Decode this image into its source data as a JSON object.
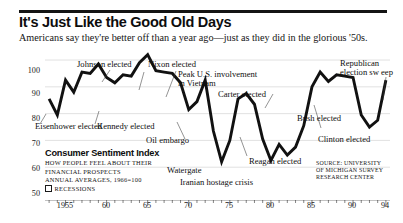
{
  "headline": "It's Just Like the Good Old Days",
  "deck": "Americans say they're better off than a year ago—just as they did in the glorious '50s.",
  "legend": {
    "title": "Consumer Sentiment Index",
    "sub1": "HOW PEOPLE FEEL ABOUT THEIR",
    "sub2": "FINANCIAL PROSPECTS",
    "sub3": "ANNUAL AVERAGES, 1966=100",
    "recessions": "RECESSIONS"
  },
  "source": "SOURCE: UNIVERSITY\nOF MICHIGAN SURVEY\nRESEARCH CENTER",
  "source_lines": [
    "SOURCE: UNIVERSITY",
    "OF MICHIGAN SURVEY",
    "RESEARCH CENTER"
  ],
  "annotations": [
    {
      "id": "eisenhower-elected",
      "text": "Eisenhower elected"
    },
    {
      "id": "kennedy-elected",
      "text": "Kennedy elected"
    },
    {
      "id": "johnson-elected",
      "text": "Johnson elected"
    },
    {
      "id": "nixon-elected",
      "text": "Nixon elected"
    },
    {
      "id": "peak-vietnam",
      "text": "Peak U.S. involvement"
    },
    {
      "id": "peak-vietnam-2",
      "text": "in Vietnam"
    },
    {
      "id": "oil-embargo",
      "text": "Oil embargo"
    },
    {
      "id": "watergate",
      "text": "Watergate"
    },
    {
      "id": "carter-elected",
      "text": "Carter elected"
    },
    {
      "id": "iranian-hostage-crisis",
      "text": "Iranian hostage crisis"
    },
    {
      "id": "reagan-elected",
      "text": "Reagan elected"
    },
    {
      "id": "bush-elected",
      "text": "Bush elected"
    },
    {
      "id": "clinton-elected",
      "text": "Clinton elected"
    },
    {
      "id": "republican-sweep",
      "text": "Republican"
    },
    {
      "id": "republican-sweep-2",
      "text": "election sw eep"
    }
  ],
  "chart_data": {
    "type": "line",
    "title": "Consumer Sentiment Index",
    "subtitle": "HOW PEOPLE FEEL ABOUT THEIR FINANCIAL PROSPECTS",
    "xlabel": "",
    "ylabel": "",
    "ylim": [
      50,
      103
    ],
    "xlim": [
      1952.5,
      1994.5
    ],
    "grid": true,
    "gridlines_y": [
      60,
      70,
      80,
      90,
      100
    ],
    "ytick_labels": [
      "100",
      "90",
      "80",
      "70",
      "60",
      "50"
    ],
    "ytick_values": [
      100,
      90,
      80,
      70,
      60,
      50
    ],
    "xtick_labels": [
      "1955",
      "60",
      "65",
      "70",
      "75",
      "80",
      "85",
      "90",
      "94"
    ],
    "xtick_values": [
      1955,
      1960,
      1965,
      1970,
      1975,
      1980,
      1985,
      1990,
      1994
    ],
    "xtick_minor_step": 1,
    "legend_position": "inside-lower-left",
    "series": [
      {
        "name": "Consumer Sentiment Index",
        "x": [
          1953,
          1954,
          1955,
          1956,
          1957,
          1958,
          1959,
          1960,
          1961,
          1962,
          1963,
          1964,
          1965,
          1966,
          1967,
          1968,
          1969,
          1970,
          1971,
          1972,
          1973,
          1974,
          1975,
          1976,
          1977,
          1978,
          1979,
          1980,
          1981,
          1982,
          1983,
          1984,
          1985,
          1986,
          1987,
          1988,
          1989,
          1990,
          1991,
          1992,
          1993,
          1994
        ],
        "values": [
          85.5,
          79.5,
          92.5,
          88.0,
          95.5,
          95.0,
          98.5,
          93.5,
          91.5,
          94.5,
          94.0,
          99.0,
          102.0,
          96.0,
          95.5,
          95.0,
          91.5,
          81.5,
          84.5,
          92.5,
          73.5,
          62.0,
          70.0,
          85.5,
          87.5,
          83.5,
          70.5,
          62.5,
          68.5,
          64.5,
          67.5,
          75.5,
          90.0,
          95.5,
          92.0,
          94.5,
          94.0,
          93.5,
          79.5,
          75.0,
          77.5,
          92.5
        ]
      }
    ],
    "annotation_points": [
      {
        "label": "Eisenhower elected",
        "x": 1953,
        "y": 85.5
      },
      {
        "label": "Kennedy elected",
        "x": 1961,
        "y": 91.5
      },
      {
        "label": "Johnson elected",
        "x": 1964,
        "y": 99.0
      },
      {
        "label": "Nixon elected",
        "x": 1969,
        "y": 91.5
      },
      {
        "label": "Peak U.S. involvement in Vietnam",
        "x": 1968,
        "y": 95.0
      },
      {
        "label": "Oil embargo",
        "x": 1973,
        "y": 73.5
      },
      {
        "label": "Watergate",
        "x": 1974,
        "y": 62.0
      },
      {
        "label": "Carter elected",
        "x": 1977,
        "y": 87.5
      },
      {
        "label": "Iranian hostage crisis",
        "x": 1980,
        "y": 62.5
      },
      {
        "label": "Reagan elected",
        "x": 1981,
        "y": 68.5
      },
      {
        "label": "Bush elected",
        "x": 1989,
        "y": 94.0
      },
      {
        "label": "Clinton elected",
        "x": 1993,
        "y": 77.5
      },
      {
        "label": "Republican election sweep",
        "x": 1994,
        "y": 92.5
      }
    ]
  }
}
